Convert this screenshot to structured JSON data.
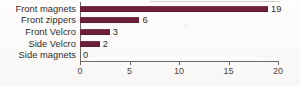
{
  "chart_data": {
    "type": "bar",
    "orientation": "horizontal",
    "title": "",
    "subtitle": "",
    "xlabel": "",
    "ylabel": "",
    "categories": [
      "Front magnets",
      "Front zippers",
      "Front Velcro",
      "Side Velcro",
      "Side magnets"
    ],
    "values": [
      19,
      6,
      3,
      2,
      0
    ],
    "data_labels": [
      "19",
      "6",
      "3",
      "2",
      "0"
    ],
    "xlim": [
      0,
      20
    ],
    "xticks": [
      0,
      5,
      10,
      15,
      20
    ],
    "xtick_labels": [
      "0",
      "5",
      "10",
      "15",
      "20"
    ],
    "grid": false,
    "legend": false,
    "legend_position": "none",
    "bar_color": "#6d1f3c",
    "axis_color": "#6e6a68",
    "text_color": "#2f2b29",
    "background_color": "#fdfcfb"
  }
}
